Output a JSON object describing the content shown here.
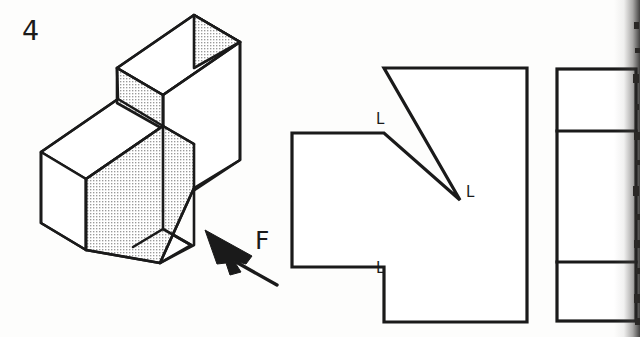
{
  "sheet": {
    "width": 640,
    "height": 337,
    "background_color": "#fdfdfc",
    "line_color": "#1a1a1a",
    "hatch_fill_color": "#d0d0d0",
    "problem_number": "4"
  },
  "isometric_view": {
    "name": "pictorial-isometric-block",
    "description": "stepped block with angled chamfer face",
    "view_direction_label": "F",
    "shaded_faces": [
      {
        "name": "top-right-end-face",
        "fill": "dotted-gray"
      },
      {
        "name": "upper-front-face",
        "fill": "dotted-gray"
      },
      {
        "name": "lower-slanted-front-face",
        "fill": "dotted-gray"
      }
    ],
    "arrow": {
      "name": "view-direction-arrow-F",
      "points_to": "front face",
      "direction": "up-left"
    }
  },
  "front_view": {
    "name": "front-view",
    "description": "hexagonal outline formed by left block, chamfered notch and right tall rectangle",
    "labels": [
      {
        "text": "L",
        "position": "upper-chamfer-vertex"
      },
      {
        "text": "L",
        "position": "chamfer-apex"
      },
      {
        "text": "L",
        "position": "lower-chamfer-vertex"
      }
    ]
  },
  "side_view": {
    "name": "right-side-view",
    "description": "tall narrow rectangle divided by two horizontal lines into three bands",
    "divider_count": 2
  },
  "scan_artifacts": {
    "right_edge_shadow": true
  }
}
